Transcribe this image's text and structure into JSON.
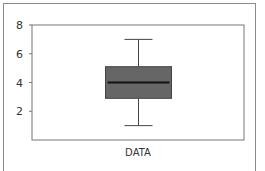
{
  "chart_data": {
    "type": "box",
    "title": "",
    "xlabel": "",
    "ylabel": "",
    "categories": [
      "DATA"
    ],
    "boxes": [
      {
        "name": "DATA",
        "whisker_low": 1.0,
        "q1": 2.9,
        "median": 4.0,
        "q3": 5.1,
        "whisker_high": 7.0
      }
    ],
    "ylim": [
      0,
      8
    ],
    "yticks": [
      2,
      4,
      6,
      8
    ],
    "grid": false,
    "legend": "none",
    "colors": {
      "box_fill": "#666666",
      "box_edge": "#444444",
      "median": "#111111",
      "whisker": "#444444",
      "frame": "#777777"
    }
  },
  "axis": {
    "y_tick_labels": [
      "2",
      "4",
      "6",
      "8"
    ],
    "x_category_label": "DATA"
  }
}
